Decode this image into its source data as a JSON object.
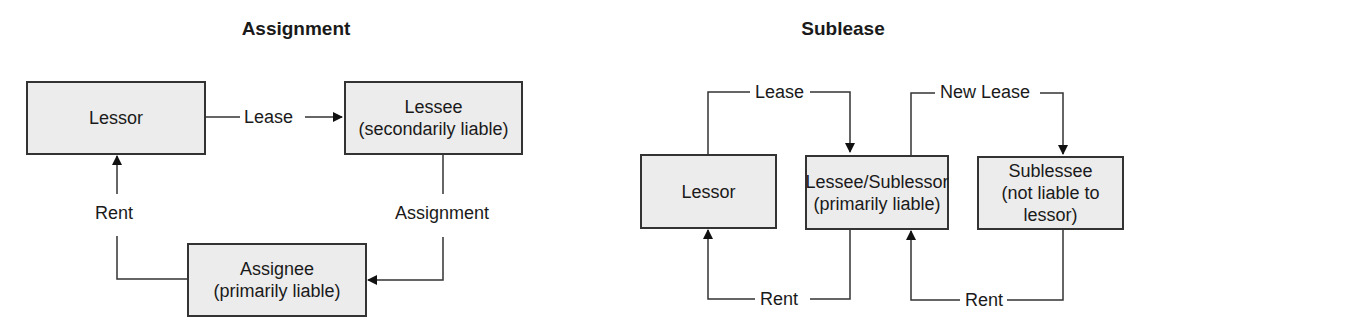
{
  "assignment": {
    "title": "Assignment",
    "boxes": {
      "lessor": {
        "line1": "Lessor"
      },
      "lessee": {
        "line1": "Lessee",
        "line2": "(secondarily liable)"
      },
      "assignee": {
        "line1": "Assignee",
        "line2": "(primarily liable)"
      }
    },
    "edges": {
      "lease": "Lease",
      "assignment": "Assignment",
      "rent": "Rent"
    }
  },
  "sublease": {
    "title": "Sublease",
    "boxes": {
      "lessor": {
        "line1": "Lessor"
      },
      "sublessor": {
        "line1": "Lessee/Sublessor",
        "line2": "(primarily liable)"
      },
      "sublessee": {
        "line1": "Sublessee",
        "line2": "(not liable to lessor)"
      }
    },
    "edges": {
      "lease": "Lease",
      "new_lease": "New Lease",
      "rent1": "Rent",
      "rent2": "Rent"
    }
  }
}
